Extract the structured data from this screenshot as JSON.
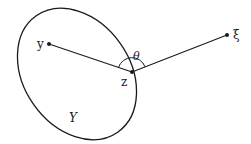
{
  "diagram": {
    "type": "geometry-figure",
    "region": {
      "label": "Y",
      "shape": "ellipse"
    },
    "points": [
      {
        "id": "y",
        "label": "y",
        "x": 49,
        "y": 44
      },
      {
        "id": "z",
        "label": "z",
        "x": 132,
        "y": 72
      },
      {
        "id": "xi",
        "label": "ξ",
        "x": 227,
        "y": 35
      }
    ],
    "segments": [
      {
        "from": "y",
        "to": "z"
      },
      {
        "from": "z",
        "to": "xi"
      }
    ],
    "angle": {
      "label": "θ",
      "vertex": "z"
    },
    "colors": {
      "stroke": "#1a1a1a",
      "background": "#ffffff"
    }
  }
}
